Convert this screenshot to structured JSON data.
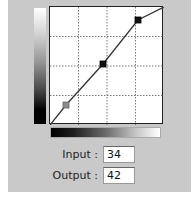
{
  "curves": {
    "grid_divisions": 4,
    "points": [
      {
        "x": 34,
        "y": 42,
        "color": "#8a8a8a",
        "label": "selected"
      },
      {
        "x": 128,
        "y": 128,
        "color": "#111111"
      },
      {
        "x": 192,
        "y": 192,
        "color": "#111111"
      }
    ],
    "range": [
      0,
      255
    ]
  },
  "fields": {
    "input_label": "Input :",
    "input_value": "34",
    "output_label": "Output :",
    "output_value": "42"
  }
}
